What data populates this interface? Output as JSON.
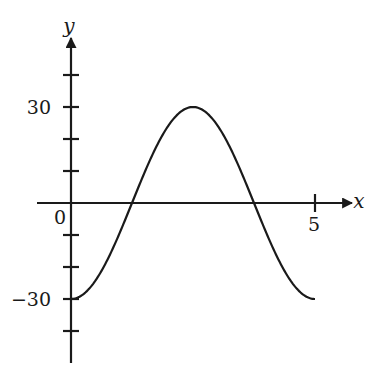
{
  "chart_data": {
    "type": "line",
    "title": "",
    "xlabel": "x",
    "ylabel": "y",
    "x_tick_labels": [
      "0",
      "5"
    ],
    "y_tick_labels": [
      "30",
      "-30"
    ],
    "y_tick_labels_display": [
      "30",
      "−30"
    ],
    "x_ticks": [
      5
    ],
    "y_ticks": [
      40,
      30,
      20,
      10,
      -10,
      -20,
      -30,
      -40
    ],
    "xlim": [
      -0.7,
      5.8
    ],
    "ylim": [
      -50,
      52
    ],
    "grid": false,
    "legend": null,
    "function": "y = -30 cos(2πx/5)",
    "series": [
      {
        "name": "curve",
        "x": [
          0,
          0.25,
          0.5,
          0.75,
          1.0,
          1.25,
          1.5,
          1.75,
          2.0,
          2.25,
          2.5,
          2.75,
          3.0,
          3.25,
          3.5,
          3.75,
          4.0,
          4.25,
          4.5,
          4.75,
          5.0
        ],
        "values": [
          -30,
          -28.5,
          -24.3,
          -17.6,
          -9.3,
          0,
          9.3,
          17.6,
          24.3,
          28.5,
          30,
          28.5,
          24.3,
          17.6,
          9.3,
          0,
          -9.3,
          -17.6,
          -24.3,
          -28.5,
          -30
        ]
      }
    ],
    "annotations": {
      "max": {
        "x": 2.5,
        "y": 30
      },
      "min": {
        "x": 0,
        "y": -30
      },
      "zeros": [
        1.25,
        3.75
      ]
    }
  },
  "layout": {
    "origin_px": [
      71,
      203
    ],
    "px_per_x": 48.8,
    "px_per_y": 3.2,
    "x_axis_px": [
      37,
      352
    ],
    "y_axis_px": [
      363,
      38
    ],
    "stroke": "#1a1a1a"
  }
}
